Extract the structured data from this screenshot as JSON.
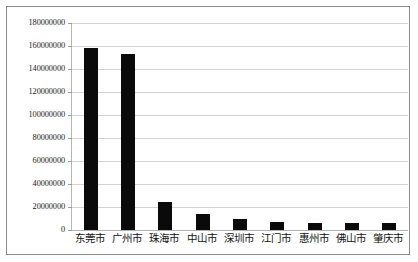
{
  "chart_data": {
    "type": "bar",
    "title": "",
    "subtitle": "",
    "xlabel": "",
    "ylabel": "",
    "categories": [
      "东莞市",
      "广州市",
      "珠海市",
      "中山市",
      "深圳市",
      "江门市",
      "惠州市",
      "佛山市",
      "肇庆市"
    ],
    "values": [
      158000000,
      153000000,
      24000000,
      14000000,
      10000000,
      7000000,
      6000000,
      6000000,
      6000000
    ],
    "series": [
      {
        "name": "",
        "values": [
          158000000,
          153000000,
          24000000,
          14000000,
          10000000,
          7000000,
          6000000,
          6000000,
          6000000
        ]
      }
    ],
    "ylim": [
      0,
      180000000
    ],
    "ytick_values": [
      0,
      20000000,
      40000000,
      60000000,
      80000000,
      100000000,
      120000000,
      140000000,
      160000000,
      180000000
    ],
    "ytick_labels": [
      "0",
      "20000000",
      "40000000",
      "60000000",
      "80000000",
      "100000000",
      "120000000",
      "140000000",
      "160000000",
      "180000000"
    ],
    "grid": true,
    "legend": false,
    "legend_position": "none",
    "bar_color": "#0a0a0a",
    "grid_color": "#d3d3d3",
    "background_color": "#ffffff",
    "border_color": "#8d8d8d"
  }
}
